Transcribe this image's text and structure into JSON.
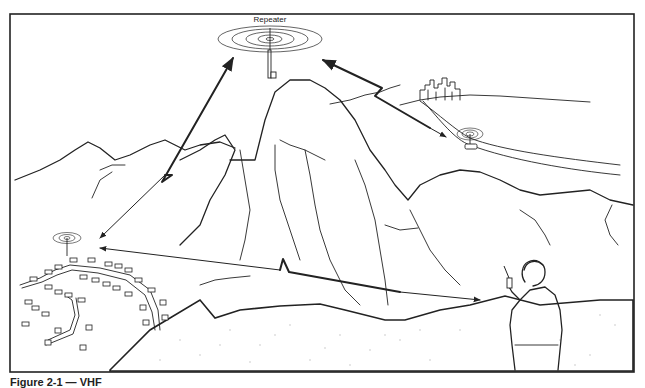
{
  "diagram": {
    "type": "radio-repeater-illustration",
    "labels": {
      "repeater": "Repeater"
    },
    "nodes": [
      {
        "id": "repeater",
        "label": "Repeater",
        "description": "Antenna tower on mountain summit with radiating signal rings"
      },
      {
        "id": "city",
        "label": "",
        "description": "City skyline on distant hills"
      },
      {
        "id": "mobile",
        "label": "",
        "description": "Vehicle with antenna on road, radiating signal rings"
      },
      {
        "id": "base",
        "label": "",
        "description": "Antenna in residential neighborhood with radiating signal rings"
      },
      {
        "id": "handheld",
        "label": "",
        "description": "Person using handheld portable radio"
      }
    ],
    "edges": [
      {
        "from": "base",
        "to": "repeater",
        "style": "double-arrow, lightning-zigzag"
      },
      {
        "from": "mobile",
        "to": "repeater",
        "style": "arrow, lightning-zigzag"
      },
      {
        "from": "handheld",
        "to": "base",
        "style": "double-arrow, lightning-zigzag"
      }
    ],
    "colors": {
      "line": "#222222",
      "background": "#ffffff",
      "stipple": "#bbbbbb"
    }
  },
  "caption": {
    "text": "Figure 2-1 — VHF"
  }
}
